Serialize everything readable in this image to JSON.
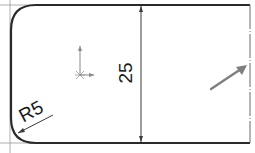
{
  "drawing": {
    "type": "cad-sketch",
    "dimensions": {
      "height": {
        "label": "25",
        "orientation": "vertical"
      },
      "radius": {
        "label": "R5",
        "applies_to": "bottom-left fillet"
      }
    },
    "icons": {
      "origin": "coordinate-origin-icon",
      "direction_arrow": "direction-arrow-icon"
    },
    "colors": {
      "outline": "#2b2b2b",
      "construction": "#7a7a7a",
      "dimension": "#3a3a3a",
      "origin": "#8a8a8a",
      "arrow": "#7f7f7f",
      "background": "#ffffff"
    }
  }
}
